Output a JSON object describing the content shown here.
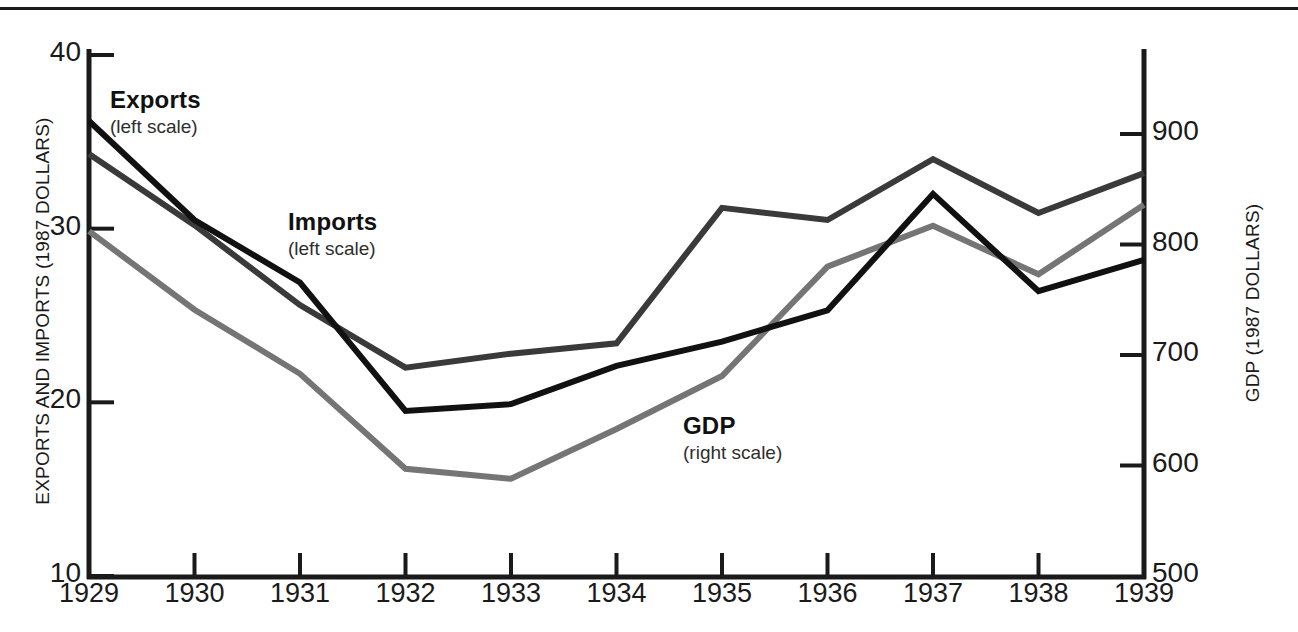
{
  "chart_data": {
    "type": "line",
    "title": "",
    "subtitle": "",
    "xlabel": "",
    "categories": [
      "1929",
      "1930",
      "1931",
      "1932",
      "1933",
      "1934",
      "1935",
      "1936",
      "1937",
      "1938",
      "1939"
    ],
    "x": [
      1929,
      1930,
      1931,
      1932,
      1933,
      1934,
      1935,
      1936,
      1937,
      1938,
      1939
    ],
    "grid": false,
    "legend_position": "inline-annotations",
    "axes": {
      "left": {
        "label": "EXPORTS AND IMPORTS (1987 DOLLARS)",
        "ticks": [
          10,
          20,
          30,
          40
        ],
        "tick_labels": [
          "10",
          "20",
          "30",
          "40"
        ],
        "ylim": [
          10,
          40
        ]
      },
      "right": {
        "label": "GDP (1987 DOLLARS)",
        "ticks": [
          500,
          600,
          700,
          800,
          900
        ],
        "tick_labels": [
          "500",
          "600",
          "700",
          "800",
          "900"
        ],
        "ylim": [
          500,
          950
        ]
      }
    },
    "series": [
      {
        "name": "Exports",
        "scale_note": "(left scale)",
        "axis": "left",
        "color": "#111111",
        "values": [
          36.2,
          30.5,
          26.9,
          19.5,
          19.9,
          22.1,
          23.5,
          25.3,
          32.0,
          26.4,
          28.2
        ]
      },
      {
        "name": "Imports",
        "scale_note": "(left scale)",
        "axis": "left",
        "color": "#3a3a3a",
        "values": [
          34.3,
          30.2,
          25.6,
          22.0,
          22.8,
          23.4,
          31.2,
          30.5,
          34.0,
          30.9,
          33.2
        ]
      },
      {
        "name": "GDP",
        "scale_note": "(right scale)",
        "axis": "right",
        "color": "#757575",
        "values": [
          812,
          741,
          683,
          597,
          588,
          633,
          681,
          780,
          817,
          773,
          836
        ]
      }
    ],
    "annotations": [
      {
        "text": "Exports",
        "sub": "(left scale)"
      },
      {
        "text": "Imports",
        "sub": "(left scale)"
      },
      {
        "text": "GDP",
        "sub": "(right scale)"
      }
    ]
  }
}
